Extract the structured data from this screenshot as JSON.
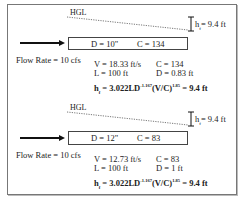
{
  "panels": [
    {
      "hgl_label": "HGL",
      "head_loss_label": "h",
      "head_loss_sub": "f",
      "head_loss_value": "= 9.4 ft",
      "pipe_d": "D = 10\"",
      "pipe_c": "C = 134",
      "flow_rate": "Flow Rate = 10 cfs",
      "velocity": "V = 18.33 ft/s",
      "c_value": "C = 134",
      "length": "L = 100 ft",
      "diameter_ft": "D = 0.83 ft",
      "formula": {
        "h": "h",
        "sub": "f",
        "body1": " = 3.022LD",
        "exp1": "-1.167",
        "body2": "(V/C)",
        "exp2": "1.85",
        "result": " = 9.4 ft"
      }
    },
    {
      "hgl_label": "HGL",
      "head_loss_label": "h",
      "head_loss_sub": "f",
      "head_loss_value": "= 9.4 ft",
      "pipe_d": "D = 12\"",
      "pipe_c": "C = 83",
      "flow_rate": "Flow Rate = 10 cfs",
      "velocity": "V = 12.73 ft/s",
      "c_value": "C = 83",
      "length": "L = 100 ft",
      "diameter_ft": "D = 1 ft",
      "formula": {
        "h": "h",
        "sub": "f",
        "body1": " = 3.022LD",
        "exp1": "-1.167",
        "body2": "(V/C)",
        "exp2": "1.85",
        "result": " = 9.4 ft"
      }
    }
  ]
}
